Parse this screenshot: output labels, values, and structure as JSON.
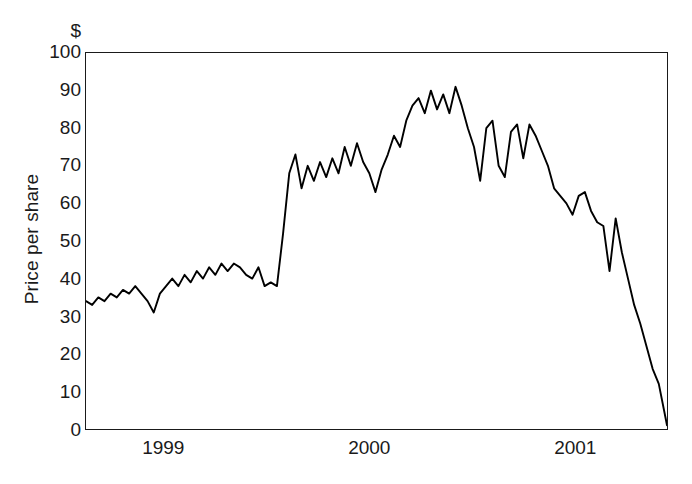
{
  "chart_data": {
    "type": "line",
    "title": "",
    "subtitle": "",
    "xlabel": "",
    "ylabel": "Price per share",
    "unit_marker": "$",
    "ylim": [
      0,
      100
    ],
    "ytick_values": [
      100,
      90,
      80,
      70,
      60,
      50,
      40,
      30,
      20,
      10,
      0
    ],
    "ytick_labels": [
      "100",
      "90",
      "80",
      "70",
      "60",
      "50",
      "40",
      "30",
      "20",
      "10",
      "0"
    ],
    "xlim": [
      1998.62,
      2001.45
    ],
    "xtick_values": [
      1999,
      2000,
      2001
    ],
    "xtick_labels": [
      "1999",
      "2000",
      "2001"
    ],
    "grid": false,
    "legend": null,
    "line_color": "#000000",
    "frame_color": "#1a1a1a",
    "background": "#ffffff",
    "series": [
      {
        "name": "Price per share",
        "x": [
          1998.62,
          1998.65,
          1998.68,
          1998.71,
          1998.74,
          1998.77,
          1998.8,
          1998.83,
          1998.86,
          1998.89,
          1998.92,
          1998.95,
          1998.98,
          1999.01,
          1999.04,
          1999.07,
          1999.1,
          1999.13,
          1999.16,
          1999.19,
          1999.22,
          1999.25,
          1999.28,
          1999.31,
          1999.34,
          1999.37,
          1999.4,
          1999.43,
          1999.46,
          1999.49,
          1999.52,
          1999.55,
          1999.58,
          1999.61,
          1999.64,
          1999.67,
          1999.7,
          1999.73,
          1999.76,
          1999.79,
          1999.82,
          1999.85,
          1999.88,
          1999.91,
          1999.94,
          1999.97,
          2000.0,
          2000.03,
          2000.06,
          2000.09,
          2000.12,
          2000.15,
          2000.18,
          2000.21,
          2000.24,
          2000.27,
          2000.3,
          2000.33,
          2000.36,
          2000.39,
          2000.42,
          2000.45,
          2000.48,
          2000.51,
          2000.54,
          2000.57,
          2000.6,
          2000.63,
          2000.66,
          2000.69,
          2000.72,
          2000.75,
          2000.78,
          2000.81,
          2000.84,
          2000.87,
          2000.9,
          2000.93,
          2000.96,
          2000.99,
          2001.02,
          2001.05,
          2001.08,
          2001.11,
          2001.14,
          2001.17,
          2001.2,
          2001.23,
          2001.26,
          2001.29,
          2001.32,
          2001.35,
          2001.38,
          2001.41,
          2001.45
        ],
        "values": [
          34,
          33,
          35,
          34,
          36,
          35,
          37,
          36,
          38,
          36,
          34,
          31,
          36,
          38,
          40,
          38,
          41,
          39,
          42,
          40,
          43,
          41,
          44,
          42,
          44,
          43,
          41,
          40,
          43,
          38,
          39,
          38,
          52,
          68,
          73,
          64,
          70,
          66,
          71,
          67,
          72,
          68,
          75,
          70,
          76,
          71,
          68,
          63,
          69,
          73,
          78,
          75,
          82,
          86,
          88,
          84,
          90,
          85,
          89,
          84,
          91,
          86,
          80,
          75,
          66,
          80,
          82,
          70,
          67,
          79,
          81,
          72,
          81,
          78,
          74,
          70,
          64,
          62,
          60,
          57,
          62,
          63,
          58,
          55,
          54,
          42,
          56,
          47,
          40,
          33,
          28,
          22,
          16,
          12,
          1
        ]
      }
    ],
    "annotations": []
  },
  "axes": {
    "y_unit_marker": "$",
    "y_title": "Price per share"
  }
}
